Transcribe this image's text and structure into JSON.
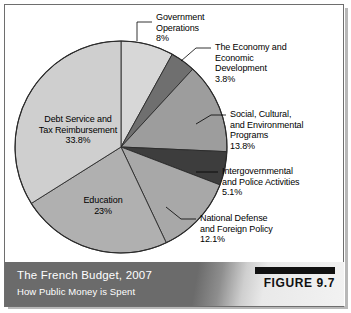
{
  "figure": {
    "title": "The French Budget, 2007",
    "subtitle": "How Public Money is Spent",
    "number_label": "FIGURE 9.7"
  },
  "chart_data": {
    "type": "pie",
    "title": "The French Budget, 2007",
    "subtitle": "How Public Money is Spent",
    "units": "percent",
    "start_angle_deg": 0,
    "direction": "clockwise",
    "legend": "none",
    "labels_placement": "callout-and-inside",
    "categories": [
      "Government Operations",
      "The Economy and Economic Development",
      "Social, Cultural, and Environmental Programs",
      "Intergovernmental and Police Activities",
      "National Defense and Foreign Policy",
      "Education",
      "Debt Service and Tax Reimbursement"
    ],
    "values": [
      8,
      3.8,
      13.8,
      5.1,
      12.1,
      23,
      33.8
    ],
    "value_labels": [
      "8%",
      "3.8%",
      "13.8%",
      "5.1%",
      "12.1%",
      "23%",
      "33.8%"
    ],
    "colors": [
      "#d7d7d7",
      "#6f6f6f",
      "#9d9d9d",
      "#3d3d3d",
      "#a8a8a8",
      "#b0b0b0",
      "#cfcfcf"
    ],
    "slices": [
      {
        "name": "Government Operations",
        "value": 8,
        "label": "8%",
        "color": "#d7d7d7"
      },
      {
        "name": "The Economy and Economic Development",
        "value": 3.8,
        "label": "3.8%",
        "color": "#6f6f6f"
      },
      {
        "name": "Social, Cultural, and Environmental Programs",
        "value": 13.8,
        "label": "13.8%",
        "color": "#9d9d9d"
      },
      {
        "name": "Intergovernmental and Police Activities",
        "value": 5.1,
        "label": "5.1%",
        "color": "#3d3d3d"
      },
      {
        "name": "National Defense and Foreign Policy",
        "value": 12.1,
        "label": "12.1%",
        "color": "#a8a8a8"
      },
      {
        "name": "Education",
        "value": 23,
        "label": "23%",
        "color": "#b0b0b0"
      },
      {
        "name": "Debt Service and Tax Reimbursement",
        "value": 33.8,
        "label": "33.8%",
        "color": "#cfcfcf"
      }
    ]
  },
  "callouts": {
    "government_operations": {
      "line1": "Government",
      "line2": "Operations",
      "line3": "8%"
    },
    "economy": {
      "line1": "The Economy and",
      "line2": "Economic",
      "line3": "Development",
      "line4": "3.8%"
    },
    "social": {
      "line1": "Social, Cultural,",
      "line2": "and Environmental",
      "line3": "Programs",
      "line4": "13.8%"
    },
    "intergovernmental": {
      "line1": "Intergovernmental",
      "line2": "and Police Activities",
      "line3": "5.1%"
    },
    "defense": {
      "line1": "National Defense",
      "line2": "and Foreign Policy",
      "line3": "12.1%"
    }
  },
  "inside_labels": {
    "debt": {
      "line1": "Debt Service and",
      "line2": "Tax Reimbursement",
      "line3": "33.8%"
    },
    "education": {
      "line1": "Education",
      "line2": "23%"
    }
  }
}
